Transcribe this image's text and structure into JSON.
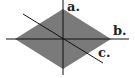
{
  "diagram": {
    "shape": "rhombus",
    "fill_color": "#7a7a7a",
    "line_color": "#111111",
    "lines": [
      {
        "label": "a.",
        "orientation": "vertical"
      },
      {
        "label": "b.",
        "orientation": "horizontal"
      },
      {
        "label": "c.",
        "orientation": "diagonal"
      }
    ]
  }
}
